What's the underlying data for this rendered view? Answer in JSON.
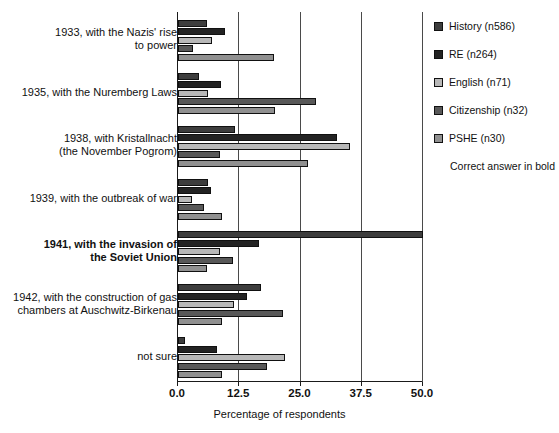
{
  "chart_data": {
    "type": "bar",
    "orientation": "horizontal",
    "title": "",
    "xlabel": "Percentage of respondents",
    "ylabel": "",
    "xlim": [
      0.0,
      50.0
    ],
    "xticks": [
      "0.0",
      "12.5",
      "25.0",
      "37.5",
      "50.0"
    ],
    "xtick_values": [
      0.0,
      12.5,
      25.0,
      37.5,
      50.0
    ],
    "grid": true,
    "legend_position": "right",
    "annotation": "Correct answer in bold",
    "correct_answer_category": "1941, with the invasion of\nthe Soviet Union",
    "categories": [
      "1933, with the Nazis' rise\nto power",
      "1935, with the Nuremberg Laws",
      "1938, with Kristallnacht\n(the November Pogrom)",
      "1939, with the outbreak of war",
      "1941, with the invasion of\nthe Soviet Union",
      "1942, with the construction of gas\nchambers at Auschwitz-Birkenau",
      "not sure"
    ],
    "series": [
      {
        "name": "History (n586)",
        "color": "#3d3d3d",
        "values": [
          6.0,
          4.3,
          11.6,
          6.2,
          50.0,
          17.0,
          1.5
        ]
      },
      {
        "name": "RE (n264)",
        "color": "#232323",
        "values": [
          9.5,
          8.8,
          32.4,
          6.8,
          16.5,
          14.0,
          8.0
        ]
      },
      {
        "name": "English (n71)",
        "color": "#b8b8b8",
        "values": [
          7.0,
          6.2,
          35.0,
          2.8,
          8.5,
          11.5,
          21.9
        ]
      },
      {
        "name": "Citizenship (n32)",
        "color": "#585858",
        "values": [
          3.1,
          28.2,
          8.5,
          5.3,
          11.3,
          21.5,
          18.2
        ]
      },
      {
        "name": "PSHE (n30)",
        "color": "#909090",
        "values": [
          19.5,
          19.8,
          26.6,
          9.0,
          6.0,
          9.0,
          9.0
        ]
      }
    ]
  },
  "legend": {
    "items": [
      {
        "label": "History (n586)"
      },
      {
        "label": "RE (n264)"
      },
      {
        "label": "English (n71)"
      },
      {
        "label": "Citizenship (n32)"
      },
      {
        "label": "PSHE (n30)"
      }
    ],
    "note": "Correct answer in bold"
  },
  "axis": {
    "x_title": "Percentage of respondents",
    "ticks": [
      "0.0",
      "12.5",
      "25.0",
      "37.5",
      "50.0"
    ]
  }
}
